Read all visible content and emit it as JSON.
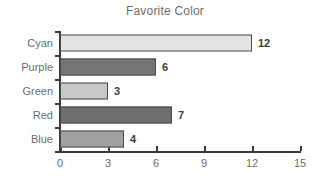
{
  "chart_data": {
    "type": "bar",
    "orientation": "horizontal",
    "title": "Favorite Color",
    "xlabel": "",
    "ylabel": "",
    "categories": [
      "Cyan",
      "Purple",
      "Green",
      "Red",
      "Blue"
    ],
    "values": [
      12,
      6,
      3,
      7,
      4
    ],
    "value_labels": [
      "12",
      "6",
      "3",
      "7",
      "4"
    ],
    "bar_colors": [
      "#e3e3e3",
      "#757575",
      "#c8c8c8",
      "#6e6e6e",
      "#a0a0a0"
    ],
    "bar_border_color": "#4a4a4a",
    "xlim": [
      0,
      15
    ],
    "xticks": [
      0,
      3,
      6,
      9,
      12,
      15
    ],
    "xtick_labels": [
      "0",
      "3",
      "6",
      "9",
      "12",
      "15"
    ],
    "grid": false,
    "legend": "none",
    "background": "#ffffff",
    "title_color": "#6e6e6e",
    "tick_label_color": "#6b6b6b",
    "value_label_color": "#3d3d3d",
    "axis_color": "#3a3a3a"
  }
}
